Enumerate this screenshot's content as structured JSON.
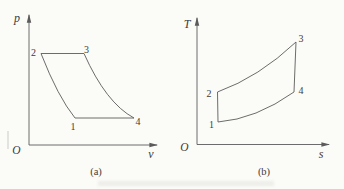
{
  "figure": {
    "width": 344,
    "height": 189,
    "background": "#fbfbf8",
    "line_color": "#5b5b5b",
    "text_color": "#3c3c3c"
  },
  "diagrams": [
    {
      "name": "pv-diagram",
      "caption": "(a)",
      "caption_pos": [
        96,
        171.5
      ],
      "axes": {
        "origin": [
          29,
          145
        ],
        "y_tip": [
          29,
          15
        ],
        "x_tip": [
          157,
          145
        ],
        "y_label": "p",
        "y_label_pos": [
          17,
          18
        ],
        "x_label": "v",
        "x_label_pos": [
          151,
          153.5
        ],
        "origin_label": "O",
        "origin_label_pos": [
          16.5,
          150
        ]
      },
      "cycle": {
        "points": {
          "1": [
            75,
            118
          ],
          "2": [
            41,
            53.5
          ],
          "3": [
            84,
            53.5
          ],
          "4": [
            134,
            118
          ]
        },
        "path_d": "M 41 53.5 L 84 53.5 Q 106 103 134 118 L 75 118 Q 58 97 41 53.5 Z",
        "point_labels": [
          {
            "text": "1",
            "pos": [
              73,
              126.5
            ]
          },
          {
            "text": "2",
            "pos": [
              33.5,
              52
            ]
          },
          {
            "text": "3",
            "pos": [
              86.5,
              49
            ]
          },
          {
            "text": "4",
            "pos": [
              138,
              121.5
            ]
          }
        ]
      }
    },
    {
      "name": "ts-diagram",
      "caption": "(b)",
      "caption_pos": [
        264,
        171.5
      ],
      "axes": {
        "origin": [
          197,
          144.5
        ],
        "y_tip": [
          197,
          18
        ],
        "x_tip": [
          329,
          144.5
        ],
        "y_label": "T",
        "y_label_pos": [
          187,
          23.5
        ],
        "x_label": "s",
        "x_label_pos": [
          321,
          154
        ],
        "origin_label": "O",
        "origin_label_pos": [
          184.5,
          146.5
        ]
      },
      "cycle": {
        "points": {
          "1": [
            218,
            122
          ],
          "2": [
            217.5,
            92
          ],
          "3": [
            296,
            42
          ],
          "4": [
            294,
            92
          ]
        },
        "path_d": "M 218 122 L 217.5 92 Q 259 77 296 42 L 294 92 Q 256 119 218 122 Z",
        "point_labels": [
          {
            "text": "1",
            "pos": [
              211.5,
              124
            ]
          },
          {
            "text": "2",
            "pos": [
              209,
              93
            ]
          },
          {
            "text": "3",
            "pos": [
              301,
              38
            ]
          },
          {
            "text": "4",
            "pos": [
              301,
              90
            ]
          }
        ]
      }
    }
  ],
  "scan_artifacts": [
    {
      "name": "faint-caption-ghost",
      "pos": [
        98,
        181
      ],
      "size": [
        176,
        5
      ],
      "color": "#e8e8e4",
      "blur": 1.5,
      "opacity": 0.75
    },
    {
      "name": "left-edge-mark",
      "pos": [
        7,
        131
      ],
      "size": [
        2,
        18
      ],
      "color": "#dededa",
      "blur": 0.5,
      "opacity": 0.8
    }
  ]
}
